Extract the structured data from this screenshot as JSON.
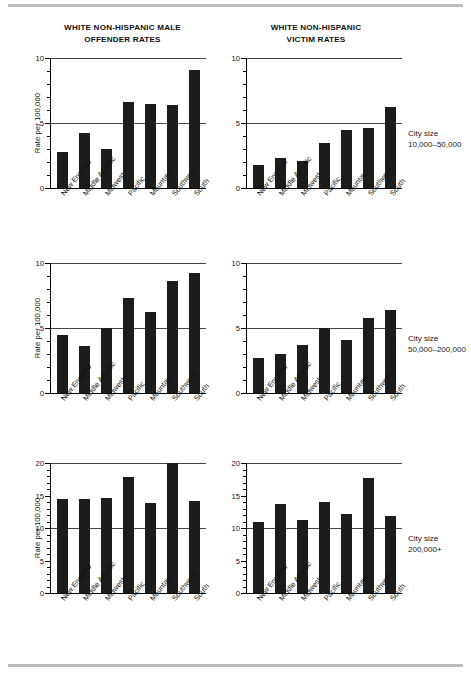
{
  "figure": {
    "column_titles": [
      "WHITE NON-HISPANIC MALE OFFENDER RATES",
      "WHITE NON-HISPANIC VICTIM RATES"
    ],
    "column_titles_lines": {
      "left_line1": "WHITE NON-HISPANIC MALE",
      "left_line2": "OFFENDER RATES",
      "right_line1": "WHITE NON-HISPANIC",
      "right_line2": "VICTIM RATES"
    },
    "row_annotations": [
      {
        "line1": "City size",
        "line2": "10,000–50,000"
      },
      {
        "line1": "City size",
        "line2": "50,000–200,000"
      },
      {
        "line1": "City size",
        "line2": "200,000+"
      }
    ],
    "axis_title": "Rate per 100,000",
    "categories": [
      "New England",
      "Middle Atlantic",
      "Midwest",
      "Pacific",
      "Mountain",
      "Southwest",
      "South"
    ],
    "bar_color": "#1c1c1c",
    "rule_color": "#b9bcc0"
  },
  "chart_data": [
    {
      "type": "bar",
      "title": "WHITE NON-HISPANIC MALE OFFENDER RATES",
      "subtitle": "City size 10,000–50,000",
      "panel": "top-left",
      "xlabel": "",
      "ylabel": "Rate per 100,000",
      "ylim": [
        0,
        10
      ],
      "yticks": [
        0,
        5,
        10
      ],
      "ytick_labels": [
        "0",
        "5",
        "10"
      ],
      "minor_tick_step": 1,
      "grid": true,
      "gridlines": [
        5,
        10
      ],
      "categories": [
        "New England",
        "Middle Atlantic",
        "Midwest",
        "Pacific",
        "Mountain",
        "Southwest",
        "South"
      ],
      "values": [
        2.8,
        4.2,
        3.0,
        6.6,
        6.5,
        6.4,
        9.1
      ]
    },
    {
      "type": "bar",
      "title": "WHITE NON-HISPANIC VICTIM RATES",
      "subtitle": "City size 10,000–50,000",
      "panel": "top-right",
      "xlabel": "",
      "ylabel": "",
      "ylim": [
        0,
        10
      ],
      "yticks": [
        0,
        5,
        10
      ],
      "ytick_labels": [
        "0",
        "5",
        "10"
      ],
      "minor_tick_step": 1,
      "grid": true,
      "gridlines": [
        5,
        10
      ],
      "categories": [
        "New England",
        "Middle Atlantic",
        "Midwest",
        "Pacific",
        "Mountain",
        "Southwest",
        "South"
      ],
      "values": [
        1.8,
        2.3,
        2.1,
        3.5,
        4.5,
        4.6,
        6.2
      ]
    },
    {
      "type": "bar",
      "title": "WHITE NON-HISPANIC MALE OFFENDER RATES",
      "subtitle": "City size 50,000–200,000",
      "panel": "middle-left",
      "xlabel": "",
      "ylabel": "Rate per 100,000",
      "ylim": [
        0,
        10
      ],
      "yticks": [
        0,
        5,
        10
      ],
      "ytick_labels": [
        "0",
        "5",
        "10"
      ],
      "minor_tick_step": 1,
      "grid": true,
      "gridlines": [
        5,
        10
      ],
      "categories": [
        "New England",
        "Middle Atlantic",
        "Midwest",
        "Pacific",
        "Mountain",
        "Southwest",
        "South"
      ],
      "values": [
        4.5,
        3.6,
        5.0,
        7.3,
        6.2,
        8.6,
        9.2
      ]
    },
    {
      "type": "bar",
      "title": "WHITE NON-HISPANIC VICTIM RATES",
      "subtitle": "City size 50,000–200,000",
      "panel": "middle-right",
      "xlabel": "",
      "ylabel": "",
      "ylim": [
        0,
        10
      ],
      "yticks": [
        0,
        5,
        10
      ],
      "ytick_labels": [
        "0",
        "5",
        "10"
      ],
      "minor_tick_step": 1,
      "grid": true,
      "gridlines": [
        5,
        10
      ],
      "categories": [
        "New England",
        "Middle Atlantic",
        "Midwest",
        "Pacific",
        "Mountain",
        "Southwest",
        "South"
      ],
      "values": [
        2.7,
        3.0,
        3.7,
        5.0,
        4.1,
        5.8,
        6.4
      ]
    },
    {
      "type": "bar",
      "title": "WHITE NON-HISPANIC MALE OFFENDER RATES",
      "subtitle": "City size 200,000+",
      "panel": "bottom-left",
      "xlabel": "",
      "ylabel": "Rate per 100,000",
      "ylim": [
        0,
        20
      ],
      "yticks": [
        0,
        5,
        10,
        15,
        20
      ],
      "ytick_labels": [
        "0",
        "5",
        "10",
        "15",
        "20"
      ],
      "minor_tick_step": 1,
      "grid": true,
      "gridlines": [
        10,
        20
      ],
      "categories": [
        "New England",
        "Middle Atlantic",
        "Midwest",
        "Pacific",
        "Mountain",
        "Southwest",
        "South"
      ],
      "values": [
        14.4,
        14.5,
        14.6,
        17.9,
        13.9,
        20.0,
        14.2
      ]
    },
    {
      "type": "bar",
      "title": "WHITE NON-HISPANIC VICTIM RATES",
      "subtitle": "City size 200,000+",
      "panel": "bottom-right",
      "xlabel": "",
      "ylabel": "",
      "ylim": [
        0,
        20
      ],
      "yticks": [
        0,
        5,
        10,
        15,
        20
      ],
      "ytick_labels": [
        "0",
        "5",
        "10",
        "15",
        "20"
      ],
      "minor_tick_step": 1,
      "grid": true,
      "gridlines": [
        10,
        20
      ],
      "categories": [
        "New England",
        "Middle Atlantic",
        "Midwest",
        "Pacific",
        "Mountain",
        "Southwest",
        "South"
      ],
      "values": [
        11.0,
        13.7,
        11.2,
        14.0,
        12.2,
        17.7,
        11.9
      ]
    }
  ]
}
